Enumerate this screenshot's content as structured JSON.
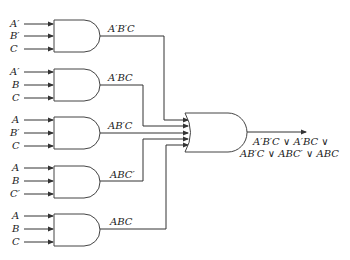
{
  "diagram": {
    "type": "logic-circuit",
    "and_gates": [
      {
        "inputs": [
          "A′",
          "B′",
          "C"
        ],
        "output": "A′B′C"
      },
      {
        "inputs": [
          "A′",
          "B",
          "C"
        ],
        "output": "A′BC"
      },
      {
        "inputs": [
          "A",
          "B′",
          "C"
        ],
        "output": "AB′C"
      },
      {
        "inputs": [
          "A",
          "B",
          "C′"
        ],
        "output": "ABC′"
      },
      {
        "inputs": [
          "A",
          "B",
          "C"
        ],
        "output": "ABC"
      }
    ],
    "or_gate": {
      "output_line1": "A′B′C ∨ A′BC ∨",
      "output_line2": "AB′C ∨ ABC′ ∨ ABC"
    },
    "colors": {
      "line": "#333333",
      "text": "#222222",
      "background": "#ffffff"
    }
  }
}
